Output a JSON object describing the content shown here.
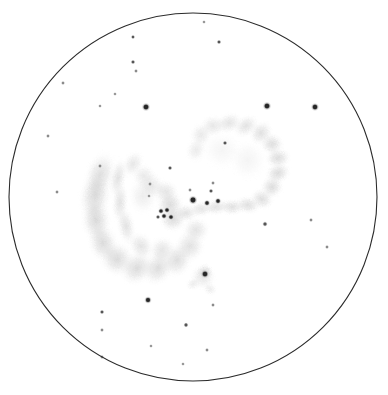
{
  "canvas": {
    "width": 388,
    "height": 395,
    "background": "#ffffff"
  },
  "field_of_view": {
    "label": "eyepiece-field-circle",
    "center_x": 193,
    "center_y": 197,
    "radius": 184,
    "stroke": "#2b2b2b",
    "stroke_width": 1.1,
    "fill": "#ffffff"
  },
  "palette": {
    "ink": "#2b2b2b",
    "star_dark": "#262626",
    "star_mid": "#555555",
    "star_faint": "#8a8a8a",
    "nebula_dark": "#9a9a9a",
    "nebula_mid": "#bdbdbd",
    "nebula_faint": "#dcdcdc",
    "paper": "#ffffff"
  },
  "objects": [
    {
      "name": "left-galaxy-tidal-arc",
      "description": "Large hooked crescent of diffuse nebulosity with an inner bright lane, opening toward upper-right",
      "centroid_x": 122,
      "centroid_y": 212,
      "brightness": "mid"
    },
    {
      "name": "right-galaxy-ring-arc",
      "description": "Open ring / broken loop of diffuse nebulosity, brightest along its eastern limb",
      "centroid_x": 235,
      "centroid_y": 175,
      "brightness": "mid"
    },
    {
      "name": "bridge-knot",
      "description": "Bright condensed junction where the two tidal structures meet; contains a tight clump of stellar points",
      "centroid_x": 170,
      "centroid_y": 212,
      "brightness": "dark"
    },
    {
      "name": "small-round-galaxy",
      "description": "Small round faint glow with a sharp stellar nucleus, south of the main pair",
      "centroid_x": 203,
      "centroid_y": 277,
      "radius": 17,
      "brightness": "faint"
    }
  ],
  "nebula_blobs": [
    {
      "cx": 100,
      "cy": 175,
      "rx": 16,
      "ry": 26,
      "rot": 18,
      "op": 0.3,
      "tone": "nebula_mid"
    },
    {
      "cx": 95,
      "cy": 196,
      "rx": 17,
      "ry": 26,
      "rot": 10,
      "op": 0.34,
      "tone": "nebula_mid"
    },
    {
      "cx": 96,
      "cy": 220,
      "rx": 16,
      "ry": 24,
      "rot": -4,
      "op": 0.34,
      "tone": "nebula_mid"
    },
    {
      "cx": 103,
      "cy": 243,
      "rx": 16,
      "ry": 22,
      "rot": -18,
      "op": 0.33,
      "tone": "nebula_mid"
    },
    {
      "cx": 117,
      "cy": 259,
      "rx": 18,
      "ry": 19,
      "rot": -32,
      "op": 0.33,
      "tone": "nebula_mid"
    },
    {
      "cx": 137,
      "cy": 268,
      "rx": 20,
      "ry": 17,
      "rot": -44,
      "op": 0.32,
      "tone": "nebula_mid"
    },
    {
      "cx": 158,
      "cy": 268,
      "rx": 20,
      "ry": 16,
      "rot": -58,
      "op": 0.31,
      "tone": "nebula_mid"
    },
    {
      "cx": 177,
      "cy": 260,
      "rx": 19,
      "ry": 16,
      "rot": -70,
      "op": 0.3,
      "tone": "nebula_mid"
    },
    {
      "cx": 190,
      "cy": 246,
      "rx": 17,
      "ry": 16,
      "rot": -80,
      "op": 0.27,
      "tone": "nebula_mid"
    },
    {
      "cx": 196,
      "cy": 230,
      "rx": 14,
      "ry": 15,
      "rot": -88,
      "op": 0.25,
      "tone": "nebula_mid"
    },
    {
      "cx": 118,
      "cy": 178,
      "rx": 9,
      "ry": 22,
      "rot": 12,
      "op": 0.26,
      "tone": "nebula_faint"
    },
    {
      "cx": 120,
      "cy": 202,
      "rx": 9,
      "ry": 22,
      "rot": 4,
      "op": 0.26,
      "tone": "nebula_faint"
    },
    {
      "cx": 126,
      "cy": 226,
      "rx": 10,
      "ry": 21,
      "rot": -12,
      "op": 0.26,
      "tone": "nebula_faint"
    },
    {
      "cx": 141,
      "cy": 246,
      "rx": 13,
      "ry": 16,
      "rot": -32,
      "op": 0.25,
      "tone": "nebula_faint"
    },
    {
      "cx": 162,
      "cy": 250,
      "rx": 15,
      "ry": 14,
      "rot": -52,
      "op": 0.24,
      "tone": "nebula_faint"
    },
    {
      "cx": 133,
      "cy": 164,
      "rx": 11,
      "ry": 15,
      "rot": 26,
      "op": 0.22,
      "tone": "nebula_faint"
    },
    {
      "cx": 144,
      "cy": 176,
      "rx": 13,
      "ry": 13,
      "rot": 34,
      "op": 0.2,
      "tone": "nebula_faint"
    },
    {
      "cx": 143,
      "cy": 196,
      "rx": 16,
      "ry": 20,
      "rot": 0,
      "op": 0.16,
      "tone": "nebula_faint"
    },
    {
      "cx": 152,
      "cy": 186,
      "rx": 15,
      "ry": 14,
      "rot": 40,
      "op": 0.2,
      "tone": "nebula_faint"
    },
    {
      "cx": 166,
      "cy": 192,
      "rx": 14,
      "ry": 13,
      "rot": 30,
      "op": 0.24,
      "tone": "nebula_mid"
    },
    {
      "cx": 170,
      "cy": 205,
      "rx": 15,
      "ry": 15,
      "rot": 10,
      "op": 0.32,
      "tone": "nebula_mid"
    },
    {
      "cx": 173,
      "cy": 219,
      "rx": 15,
      "ry": 14,
      "rot": -10,
      "op": 0.32,
      "tone": "nebula_mid"
    },
    {
      "cx": 186,
      "cy": 213,
      "rx": 13,
      "ry": 10,
      "rot": 0,
      "op": 0.26,
      "tone": "nebula_mid"
    },
    {
      "cx": 201,
      "cy": 209,
      "rx": 13,
      "ry": 9,
      "rot": -6,
      "op": 0.24,
      "tone": "nebula_mid"
    },
    {
      "cx": 216,
      "cy": 207,
      "rx": 14,
      "ry": 9,
      "rot": -8,
      "op": 0.26,
      "tone": "nebula_mid"
    },
    {
      "cx": 232,
      "cy": 207,
      "rx": 14,
      "ry": 9,
      "rot": 0,
      "op": 0.28,
      "tone": "nebula_mid"
    },
    {
      "cx": 248,
      "cy": 205,
      "rx": 14,
      "ry": 10,
      "rot": 8,
      "op": 0.29,
      "tone": "nebula_mid"
    },
    {
      "cx": 262,
      "cy": 199,
      "rx": 13,
      "ry": 11,
      "rot": 26,
      "op": 0.3,
      "tone": "nebula_mid"
    },
    {
      "cx": 272,
      "cy": 187,
      "rx": 12,
      "ry": 13,
      "rot": 48,
      "op": 0.31,
      "tone": "nebula_mid"
    },
    {
      "cx": 278,
      "cy": 173,
      "rx": 11,
      "ry": 14,
      "rot": 70,
      "op": 0.32,
      "tone": "nebula_mid"
    },
    {
      "cx": 278,
      "cy": 158,
      "rx": 11,
      "ry": 14,
      "rot": 86,
      "op": 0.31,
      "tone": "nebula_mid"
    },
    {
      "cx": 272,
      "cy": 144,
      "rx": 12,
      "ry": 13,
      "rot": 108,
      "op": 0.3,
      "tone": "nebula_mid"
    },
    {
      "cx": 261,
      "cy": 133,
      "rx": 14,
      "ry": 12,
      "rot": 126,
      "op": 0.28,
      "tone": "nebula_mid"
    },
    {
      "cx": 246,
      "cy": 126,
      "rx": 15,
      "ry": 11,
      "rot": 144,
      "op": 0.26,
      "tone": "nebula_faint"
    },
    {
      "cx": 229,
      "cy": 123,
      "rx": 15,
      "ry": 11,
      "rot": 160,
      "op": 0.24,
      "tone": "nebula_faint"
    },
    {
      "cx": 213,
      "cy": 126,
      "rx": 14,
      "ry": 12,
      "rot": 172,
      "op": 0.22,
      "tone": "nebula_faint"
    },
    {
      "cx": 201,
      "cy": 135,
      "rx": 12,
      "ry": 13,
      "rot": 190,
      "op": 0.2,
      "tone": "nebula_faint"
    },
    {
      "cx": 196,
      "cy": 150,
      "rx": 11,
      "ry": 14,
      "rot": 200,
      "op": 0.18,
      "tone": "nebula_faint"
    },
    {
      "cx": 222,
      "cy": 150,
      "rx": 22,
      "ry": 20,
      "rot": 0,
      "op": 0.09,
      "tone": "nebula_faint"
    },
    {
      "cx": 248,
      "cy": 160,
      "rx": 20,
      "ry": 22,
      "rot": 0,
      "op": 0.1,
      "tone": "nebula_faint"
    },
    {
      "cx": 203,
      "cy": 277,
      "rx": 14,
      "ry": 14,
      "rot": 0,
      "op": 0.22,
      "tone": "nebula_faint"
    },
    {
      "cx": 205,
      "cy": 272,
      "rx": 9,
      "ry": 9,
      "rot": 0,
      "op": 0.26,
      "tone": "nebula_mid"
    },
    {
      "cx": 210,
      "cy": 289,
      "rx": 8,
      "ry": 7,
      "rot": 30,
      "op": 0.16,
      "tone": "nebula_faint"
    },
    {
      "cx": 193,
      "cy": 284,
      "rx": 8,
      "ry": 7,
      "rot": -20,
      "op": 0.16,
      "tone": "nebula_faint"
    }
  ],
  "stars": [
    {
      "x": 204,
      "y": 22,
      "r": 1.1,
      "tone": "star_faint"
    },
    {
      "x": 133,
      "y": 37,
      "r": 1.2,
      "tone": "star_mid"
    },
    {
      "x": 219,
      "y": 42,
      "r": 1.3,
      "tone": "star_mid"
    },
    {
      "x": 133,
      "y": 62,
      "r": 1.3,
      "tone": "star_mid"
    },
    {
      "x": 136,
      "y": 71,
      "r": 1.2,
      "tone": "star_faint"
    },
    {
      "x": 115,
      "y": 94,
      "r": 1.1,
      "tone": "star_faint"
    },
    {
      "x": 63,
      "y": 83,
      "r": 1.2,
      "tone": "star_faint"
    },
    {
      "x": 100,
      "y": 106,
      "r": 1.1,
      "tone": "star_faint"
    },
    {
      "x": 146,
      "y": 107,
      "r": 2.3,
      "tone": "star_dark"
    },
    {
      "x": 267,
      "y": 106,
      "r": 2.3,
      "tone": "star_dark"
    },
    {
      "x": 315,
      "y": 107,
      "r": 2.2,
      "tone": "star_dark"
    },
    {
      "x": 48,
      "y": 136,
      "r": 1.2,
      "tone": "star_faint"
    },
    {
      "x": 225,
      "y": 143,
      "r": 1.3,
      "tone": "star_mid"
    },
    {
      "x": 100,
      "y": 166,
      "r": 1.2,
      "tone": "star_faint"
    },
    {
      "x": 170,
      "y": 168,
      "r": 1.3,
      "tone": "star_mid"
    },
    {
      "x": 57,
      "y": 192,
      "r": 1.2,
      "tone": "star_faint"
    },
    {
      "x": 150,
      "y": 184,
      "r": 1.2,
      "tone": "star_faint"
    },
    {
      "x": 213,
      "y": 183,
      "r": 1.2,
      "tone": "star_faint"
    },
    {
      "x": 149,
      "y": 196,
      "r": 1.1,
      "tone": "star_faint"
    },
    {
      "x": 190,
      "y": 190,
      "r": 1.2,
      "tone": "star_faint"
    },
    {
      "x": 211,
      "y": 191,
      "r": 1.3,
      "tone": "star_mid"
    },
    {
      "x": 193,
      "y": 200,
      "r": 2.4,
      "tone": "star_dark"
    },
    {
      "x": 207,
      "y": 203,
      "r": 1.7,
      "tone": "star_dark"
    },
    {
      "x": 218,
      "y": 201,
      "r": 1.7,
      "tone": "star_dark"
    },
    {
      "x": 161,
      "y": 211,
      "r": 1.6,
      "tone": "star_dark"
    },
    {
      "x": 167,
      "y": 210,
      "r": 1.6,
      "tone": "star_dark"
    },
    {
      "x": 164,
      "y": 216,
      "r": 1.6,
      "tone": "star_dark"
    },
    {
      "x": 171,
      "y": 217,
      "r": 1.6,
      "tone": "star_dark"
    },
    {
      "x": 158,
      "y": 217,
      "r": 1.3,
      "tone": "star_mid"
    },
    {
      "x": 265,
      "y": 224,
      "r": 1.5,
      "tone": "star_mid"
    },
    {
      "x": 311,
      "y": 220,
      "r": 1.2,
      "tone": "star_faint"
    },
    {
      "x": 327,
      "y": 247,
      "r": 1.2,
      "tone": "star_faint"
    },
    {
      "x": 205,
      "y": 274,
      "r": 2.2,
      "tone": "star_dark"
    },
    {
      "x": 148,
      "y": 300,
      "r": 2.0,
      "tone": "star_dark"
    },
    {
      "x": 102,
      "y": 312,
      "r": 1.3,
      "tone": "star_mid"
    },
    {
      "x": 213,
      "y": 305,
      "r": 1.2,
      "tone": "star_faint"
    },
    {
      "x": 186,
      "y": 325,
      "r": 1.4,
      "tone": "star_mid"
    },
    {
      "x": 102,
      "y": 330,
      "r": 1.2,
      "tone": "star_faint"
    },
    {
      "x": 207,
      "y": 350,
      "r": 1.2,
      "tone": "star_faint"
    },
    {
      "x": 102,
      "y": 357,
      "r": 1.2,
      "tone": "star_faint"
    },
    {
      "x": 183,
      "y": 364,
      "r": 1.1,
      "tone": "star_faint"
    },
    {
      "x": 151,
      "y": 346,
      "r": 1.1,
      "tone": "star_faint"
    }
  ]
}
